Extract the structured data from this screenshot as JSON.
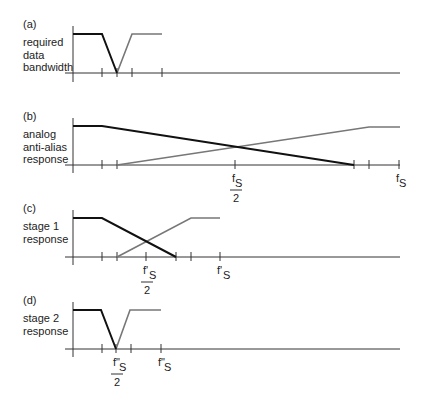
{
  "colors": {
    "background": "#ffffff",
    "axis": "#333333",
    "dark_curve": "#111111",
    "grey_curve": "#777777",
    "text": "#222222"
  },
  "panels": [
    {
      "id": "a",
      "tag": "(a)",
      "label_lines": [
        "required",
        "data",
        "bandwidth"
      ],
      "tag_y": 28,
      "label_y": 46,
      "axis": {
        "x0": 73,
        "x1": 400,
        "y_base": 73,
        "y_top": 26,
        "y_bottom": 82
      },
      "high_y": 34,
      "ticks": [
        102,
        117,
        132,
        162
      ],
      "dark_curve": [
        [
          73,
          34
        ],
        [
          102,
          34
        ],
        [
          117,
          73
        ]
      ],
      "grey_curve": [
        [
          117,
          73
        ],
        [
          132,
          34
        ],
        [
          162,
          34
        ]
      ],
      "tick_labels": []
    },
    {
      "id": "b",
      "tag": "(b)",
      "label_lines": [
        "analog",
        "anti-alias",
        "response"
      ],
      "tag_y": 120,
      "label_y": 138,
      "axis": {
        "x0": 73,
        "x1": 400,
        "y_base": 165,
        "y_top": 118,
        "y_bottom": 173
      },
      "high_y": 126,
      "ticks": [
        102,
        117,
        235,
        354,
        369,
        399
      ],
      "dark_curve": [
        [
          73,
          126
        ],
        [
          102,
          126
        ],
        [
          354,
          165
        ]
      ],
      "grey_curve": [
        [
          117,
          165
        ],
        [
          369,
          127
        ],
        [
          400,
          127
        ]
      ],
      "tick_labels": [
        {
          "x": 235,
          "num": "f",
          "sub": "S",
          "den": "2",
          "fraction": true
        },
        {
          "x": 399,
          "num": "f",
          "sub": "S",
          "fraction": false
        }
      ]
    },
    {
      "id": "c",
      "tag": "(c)",
      "label_lines": [
        "stage 1",
        "response"
      ],
      "tag_y": 212,
      "label_y": 230,
      "axis": {
        "x0": 73,
        "x1": 400,
        "y_base": 257,
        "y_top": 210,
        "y_bottom": 265
      },
      "high_y": 218,
      "ticks": [
        102,
        117,
        146,
        176,
        191,
        220
      ],
      "dark_curve": [
        [
          73,
          218
        ],
        [
          102,
          218
        ],
        [
          176,
          257
        ]
      ],
      "grey_curve": [
        [
          117,
          257
        ],
        [
          191,
          218
        ],
        [
          220,
          218
        ]
      ],
      "tick_labels": [
        {
          "x": 146,
          "num": "f'",
          "sub": "S",
          "den": "2",
          "fraction": true
        },
        {
          "x": 220,
          "num": "f'",
          "sub": "S",
          "fraction": false
        }
      ]
    },
    {
      "id": "d",
      "tag": "(d)",
      "label_lines": [
        "stage 2",
        "response"
      ],
      "tag_y": 304,
      "label_y": 322,
      "axis": {
        "x0": 73,
        "x1": 400,
        "y_base": 349,
        "y_top": 302,
        "y_bottom": 357
      },
      "high_y": 310,
      "ticks": [
        102,
        116,
        131,
        161
      ],
      "dark_curve": [
        [
          73,
          310
        ],
        [
          101,
          310
        ],
        [
          116,
          349
        ]
      ],
      "grey_curve": [
        [
          116,
          349
        ],
        [
          130,
          310
        ],
        [
          161,
          310
        ]
      ],
      "tick_labels": [
        {
          "x": 116,
          "num": "f\"",
          "sub": "S",
          "den": "2",
          "fraction": true
        },
        {
          "x": 161,
          "num": "f\"",
          "sub": "S",
          "fraction": false
        }
      ]
    }
  ]
}
